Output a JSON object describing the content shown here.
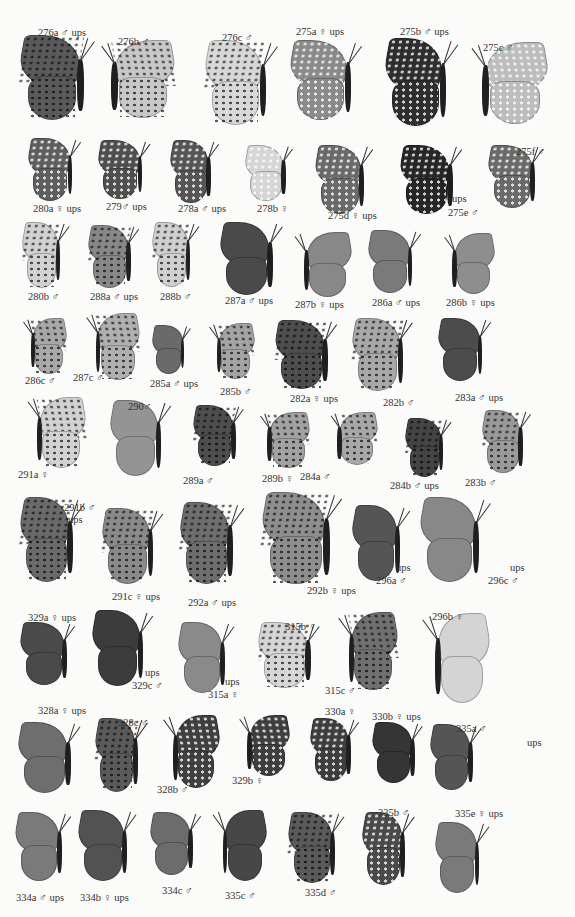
{
  "plate": {
    "background": "#fbfbfa",
    "specimens": [
      {
        "id": "276a",
        "label": "276a ♂ ups",
        "x": 20,
        "y": 35,
        "w": 75,
        "h": 85,
        "tone": "#5a5a5a",
        "pattern": "dark-spots",
        "lx": 38,
        "ly": 28
      },
      {
        "id": "276b",
        "label": "276b ♂",
        "x": 100,
        "y": 40,
        "w": 75,
        "h": 78,
        "tone": "#c8c8c8",
        "pattern": "dark-spots",
        "flip": true,
        "lx": 118,
        "ly": 37
      },
      {
        "id": "276c",
        "label": "276c ♂",
        "x": 205,
        "y": 40,
        "w": 72,
        "h": 85,
        "tone": "#d8d8d8",
        "pattern": "dark-spots",
        "lx": 222,
        "ly": 33
      },
      {
        "id": "275a",
        "label": "275a ♀ ups",
        "x": 290,
        "y": 40,
        "w": 72,
        "h": 80,
        "tone": "#8a8a8a",
        "pattern": "light-spots",
        "lx": 296,
        "ly": 27
      },
      {
        "id": "275b",
        "label": "275b ♂ ups",
        "x": 385,
        "y": 38,
        "w": 72,
        "h": 88,
        "tone": "#2e2e2e",
        "pattern": "light-spots",
        "lx": 400,
        "ly": 27
      },
      {
        "id": "275c",
        "label": "275c ♂",
        "x": 470,
        "y": 42,
        "w": 78,
        "h": 82,
        "tone": "#bdbdbd",
        "pattern": "light-spots",
        "flip": true,
        "lx": 483,
        "ly": 43
      },
      {
        "id": "280a",
        "label": "280a ♀ ups",
        "x": 28,
        "y": 138,
        "w": 52,
        "h": 62,
        "tone": "#5e5e5e",
        "pattern": "light-spots",
        "lx": 33,
        "ly": 204
      },
      {
        "id": "279",
        "label": "279♂ ups",
        "x": 98,
        "y": 140,
        "w": 52,
        "h": 58,
        "tone": "#4f4f4f",
        "pattern": "light-spots",
        "lx": 106,
        "ly": 202
      },
      {
        "id": "278a",
        "label": "278a ♂ ups",
        "x": 170,
        "y": 140,
        "w": 48,
        "h": 62,
        "tone": "#555555",
        "pattern": "light-spots",
        "lx": 178,
        "ly": 204
      },
      {
        "id": "278b",
        "label": "278b ♀",
        "x": 245,
        "y": 145,
        "w": 48,
        "h": 55,
        "tone": "#d6d6d6",
        "pattern": "light-spots",
        "lx": 257,
        "ly": 204
      },
      {
        "id": "275d",
        "label": "275d ♀ ups",
        "x": 315,
        "y": 145,
        "w": 58,
        "h": 68,
        "tone": "#6a6a6a",
        "pattern": "light-spots",
        "lx": 328,
        "ly": 211
      },
      {
        "id": "275e",
        "label": "275e ♂",
        "x": 400,
        "y": 145,
        "w": 62,
        "h": 68,
        "tone": "#262626",
        "pattern": "light-spots",
        "lx": 448,
        "ly": 208
      },
      {
        "id": "275f",
        "label": "275f ♂",
        "x": 488,
        "y": 145,
        "w": 55,
        "h": 62,
        "tone": "#6a6a6a",
        "pattern": "light-spots",
        "lx": 516,
        "ly": 147
      },
      {
        "id": "280b",
        "label": "280b ♂",
        "x": 22,
        "y": 222,
        "w": 45,
        "h": 65,
        "tone": "#d2d2d2",
        "pattern": "dark-spots",
        "lx": 28,
        "ly": 292
      },
      {
        "id": "288a",
        "label": "288a ♂ ups",
        "x": 88,
        "y": 225,
        "w": 50,
        "h": 62,
        "tone": "#888888",
        "pattern": "dark-spots",
        "lx": 90,
        "ly": 292
      },
      {
        "id": "288b",
        "label": "288b ♂",
        "x": 152,
        "y": 222,
        "w": 45,
        "h": 64,
        "tone": "#d0d0d0",
        "pattern": "dark-spots",
        "lx": 160,
        "ly": 292
      },
      {
        "id": "287a",
        "label": "287a ♂ ups",
        "x": 220,
        "y": 222,
        "w": 62,
        "h": 72,
        "tone": "#4a4a4a",
        "pattern": "none",
        "lx": 225,
        "ly": 296
      },
      {
        "id": "287b",
        "label": "287b ♀ ups",
        "x": 295,
        "y": 232,
        "w": 57,
        "h": 64,
        "tone": "#888888",
        "pattern": "none",
        "flip": true,
        "lx": 295,
        "ly": 300
      },
      {
        "id": "286a",
        "label": "286a ♂ ups",
        "x": 368,
        "y": 230,
        "w": 52,
        "h": 62,
        "tone": "#7a7a7a",
        "pattern": "none",
        "lx": 372,
        "ly": 298
      },
      {
        "id": "286b",
        "label": "286b ♀ ups",
        "x": 445,
        "y": 233,
        "w": 50,
        "h": 60,
        "tone": "#8e8e8e",
        "pattern": "none",
        "flip": true,
        "lx": 446,
        "ly": 298
      },
      {
        "id": "286c",
        "label": "286c ♂",
        "x": 25,
        "y": 318,
        "w": 42,
        "h": 55,
        "tone": "#a8a8a8",
        "pattern": "dark-spots",
        "flip": true,
        "lx": 25,
        "ly": 376
      },
      {
        "id": "287c",
        "label": "287c ♂",
        "x": 88,
        "y": 313,
        "w": 52,
        "h": 66,
        "tone": "#b0b0b0",
        "pattern": "dark-spots",
        "flip": true,
        "lx": 73,
        "ly": 373
      },
      {
        "id": "285a",
        "label": "285a ♂ ups",
        "x": 152,
        "y": 325,
        "w": 38,
        "h": 48,
        "tone": "#6a6a6a",
        "pattern": "none",
        "lx": 150,
        "ly": 379
      },
      {
        "id": "285b",
        "label": "285b ♂",
        "x": 210,
        "y": 323,
        "w": 45,
        "h": 55,
        "tone": "#a4a4a4",
        "pattern": "dark-spots",
        "flip": true,
        "lx": 220,
        "ly": 387
      },
      {
        "id": "282a",
        "label": "282a ♀ ups",
        "x": 275,
        "y": 320,
        "w": 62,
        "h": 68,
        "tone": "#4e4e4e",
        "pattern": "dark-spots",
        "lx": 290,
        "ly": 394
      },
      {
        "id": "282b",
        "label": "282b ♂",
        "x": 352,
        "y": 318,
        "w": 60,
        "h": 72,
        "tone": "#a8a8a8",
        "pattern": "dark-spots",
        "lx": 383,
        "ly": 398
      },
      {
        "id": "283a",
        "label": "283a ♂ ups",
        "x": 438,
        "y": 318,
        "w": 52,
        "h": 62,
        "tone": "#4c4c4c",
        "pattern": "none",
        "lx": 455,
        "ly": 393
      },
      {
        "id": "291a",
        "label": "291a ♀",
        "x": 28,
        "y": 397,
        "w": 58,
        "h": 70,
        "tone": "#d2d2d2",
        "pattern": "dark-spots",
        "flip": true,
        "lx": 18,
        "ly": 470
      },
      {
        "id": "290",
        "label": "290♂",
        "x": 110,
        "y": 400,
        "w": 60,
        "h": 75,
        "tone": "#949494",
        "pattern": "none",
        "lx": 128,
        "ly": 402
      },
      {
        "id": "289a",
        "label": "289a ♂",
        "x": 193,
        "y": 405,
        "w": 50,
        "h": 60,
        "tone": "#4e4e4e",
        "pattern": "dark-spots",
        "lx": 183,
        "ly": 476
      },
      {
        "id": "289b",
        "label": "289b ♀",
        "x": 260,
        "y": 412,
        "w": 50,
        "h": 55,
        "tone": "#a2a2a2",
        "pattern": "dark-spots",
        "flip": true,
        "lx": 262,
        "ly": 474
      },
      {
        "id": "284a",
        "label": "284a ♂",
        "x": 330,
        "y": 412,
        "w": 48,
        "h": 52,
        "tone": "#a8a8a8",
        "pattern": "dark-spots",
        "flip": true,
        "lx": 300,
        "ly": 472
      },
      {
        "id": "284b",
        "label": "284b ♂ ups",
        "x": 405,
        "y": 418,
        "w": 45,
        "h": 58,
        "tone": "#444444",
        "pattern": "dark-spots",
        "lx": 390,
        "ly": 481
      },
      {
        "id": "283b",
        "label": "283b ♂",
        "x": 482,
        "y": 410,
        "w": 48,
        "h": 62,
        "tone": "#9a9a9a",
        "pattern": "dark-spots",
        "lx": 465,
        "ly": 478
      },
      {
        "id": "291b",
        "label": "291b ♂",
        "x": 20,
        "y": 497,
        "w": 62,
        "h": 85,
        "tone": "#6a6a6a",
        "pattern": "dark-spots",
        "lx": 64,
        "ly": 503
      },
      {
        "id": "291c",
        "label": "291c ♀ ups",
        "x": 102,
        "y": 508,
        "w": 60,
        "h": 75,
        "tone": "#8a8a8a",
        "pattern": "dark-spots",
        "lx": 112,
        "ly": 592
      },
      {
        "id": "292a",
        "label": "292a ♂ ups",
        "x": 180,
        "y": 502,
        "w": 62,
        "h": 82,
        "tone": "#6e6e6e",
        "pattern": "dark-spots",
        "lx": 188,
        "ly": 598
      },
      {
        "id": "292b",
        "label": "292b ♀ ups",
        "x": 262,
        "y": 492,
        "w": 80,
        "h": 92,
        "tone": "#8e8e8e",
        "pattern": "dark-spots",
        "lx": 307,
        "ly": 586
      },
      {
        "id": "296a",
        "label": "296a ♂",
        "x": 352,
        "y": 505,
        "w": 56,
        "h": 75,
        "tone": "#555555",
        "pattern": "none",
        "lx": 376,
        "ly": 576
      },
      {
        "id": "296c",
        "label": "296c ♂",
        "x": 420,
        "y": 497,
        "w": 70,
        "h": 85,
        "tone": "#888888",
        "pattern": "none",
        "lx": 488,
        "ly": 576
      },
      {
        "id": "329a",
        "label": "329a ♀ ups",
        "x": 20,
        "y": 622,
        "w": 55,
        "h": 62,
        "tone": "#4a4a4a",
        "pattern": "none",
        "lx": 28,
        "ly": 613
      },
      {
        "id": "329c",
        "label": "329c ♂",
        "x": 92,
        "y": 610,
        "w": 60,
        "h": 75,
        "tone": "#3c3c3c",
        "pattern": "none",
        "lx": 132,
        "ly": 681
      },
      {
        "id": "315a",
        "label": "315a ♀",
        "x": 178,
        "y": 622,
        "w": 55,
        "h": 70,
        "tone": "#8a8a8a",
        "pattern": "none",
        "lx": 208,
        "ly": 690
      },
      {
        "id": "315b",
        "label": "315b ♀",
        "x": 258,
        "y": 622,
        "w": 62,
        "h": 65,
        "tone": "#d6d6d6",
        "pattern": "dark-spots",
        "lx": 285,
        "ly": 622
      },
      {
        "id": "315c",
        "label": "315c ♂",
        "x": 340,
        "y": 612,
        "w": 58,
        "h": 78,
        "tone": "#707070",
        "pattern": "dark-spots",
        "flip": true,
        "lx": 325,
        "ly": 686
      },
      {
        "id": "296b",
        "label": "296b ♀",
        "x": 425,
        "y": 613,
        "w": 65,
        "h": 90,
        "tone": "#d4d4d4",
        "pattern": "none",
        "flip": true,
        "lx": 432,
        "ly": 612
      },
      {
        "id": "328a",
        "label": "328a ♀ ups",
        "x": 18,
        "y": 722,
        "w": 62,
        "h": 70,
        "tone": "#6e6e6e",
        "pattern": "none",
        "lx": 38,
        "ly": 706
      },
      {
        "id": "328c",
        "label": "328c ♂",
        "x": 95,
        "y": 718,
        "w": 50,
        "h": 73,
        "tone": "#5a5a5a",
        "pattern": "dark-spots",
        "lx": 118,
        "ly": 718
      },
      {
        "id": "328b",
        "label": "328b ♂",
        "x": 165,
        "y": 715,
        "w": 55,
        "h": 72,
        "tone": "#3f3f3f",
        "pattern": "light-spots",
        "flip": true,
        "lx": 157,
        "ly": 785
      },
      {
        "id": "329b",
        "label": "329b ♀",
        "x": 240,
        "y": 715,
        "w": 50,
        "h": 60,
        "tone": "#3e3e3e",
        "pattern": "light-spots",
        "flip": true,
        "lx": 232,
        "ly": 776
      },
      {
        "id": "330a",
        "label": "330a ♀",
        "x": 310,
        "y": 718,
        "w": 48,
        "h": 62,
        "tone": "#3e3e3e",
        "pattern": "light-spots",
        "lx": 325,
        "ly": 707
      },
      {
        "id": "330b",
        "label": "330b ♀ ups",
        "x": 372,
        "y": 722,
        "w": 50,
        "h": 60,
        "tone": "#353535",
        "pattern": "none",
        "lx": 372,
        "ly": 712
      },
      {
        "id": "335a",
        "label": "335a ♂",
        "x": 430,
        "y": 724,
        "w": 50,
        "h": 65,
        "tone": "#555555",
        "pattern": "none",
        "lx": 456,
        "ly": 724
      },
      {
        "id": "334a",
        "label": "334a ♂ ups",
        "x": 15,
        "y": 812,
        "w": 55,
        "h": 68,
        "tone": "#7a7a7a",
        "pattern": "none",
        "lx": 16,
        "ly": 893
      },
      {
        "id": "334b",
        "label": "334b ♀ ups",
        "x": 78,
        "y": 810,
        "w": 58,
        "h": 70,
        "tone": "#525252",
        "pattern": "none",
        "lx": 80,
        "ly": 893
      },
      {
        "id": "334c",
        "label": "334c ♂",
        "x": 150,
        "y": 812,
        "w": 50,
        "h": 62,
        "tone": "#6c6c6c",
        "pattern": "none",
        "lx": 162,
        "ly": 886
      },
      {
        "id": "335c",
        "label": "335c ♂",
        "x": 215,
        "y": 810,
        "w": 52,
        "h": 70,
        "tone": "#474747",
        "pattern": "none",
        "flip": true,
        "lx": 225,
        "ly": 891
      },
      {
        "id": "335d",
        "label": "335d ♂",
        "x": 288,
        "y": 812,
        "w": 55,
        "h": 70,
        "tone": "#5a5a5a",
        "pattern": "dark-spots",
        "lx": 305,
        "ly": 888
      },
      {
        "id": "335b",
        "label": "335b ♂",
        "x": 362,
        "y": 812,
        "w": 50,
        "h": 72,
        "tone": "#4a4a4a",
        "pattern": "light-spots",
        "lx": 378,
        "ly": 808
      },
      {
        "id": "335e",
        "label": "335e ♀ ups",
        "x": 435,
        "y": 822,
        "w": 52,
        "h": 70,
        "tone": "#7a7a7a",
        "pattern": "none",
        "lx": 455,
        "ly": 809
      }
    ],
    "extra_labels": [
      {
        "id": "291b-ups",
        "text": "ups",
        "x": 68,
        "y": 515
      },
      {
        "id": "275e-ups",
        "text": "ups",
        "x": 452,
        "y": 194
      },
      {
        "id": "296a-ups",
        "text": "ups",
        "x": 396,
        "y": 563
      },
      {
        "id": "296c-ups",
        "text": "ups",
        "x": 510,
        "y": 563
      },
      {
        "id": "329c-ups",
        "text": "ups",
        "x": 145,
        "y": 668
      },
      {
        "id": "315a-ups",
        "text": "ups",
        "x": 225,
        "y": 677
      },
      {
        "id": "335a-ups",
        "text": "ups",
        "x": 527,
        "y": 738
      }
    ]
  }
}
